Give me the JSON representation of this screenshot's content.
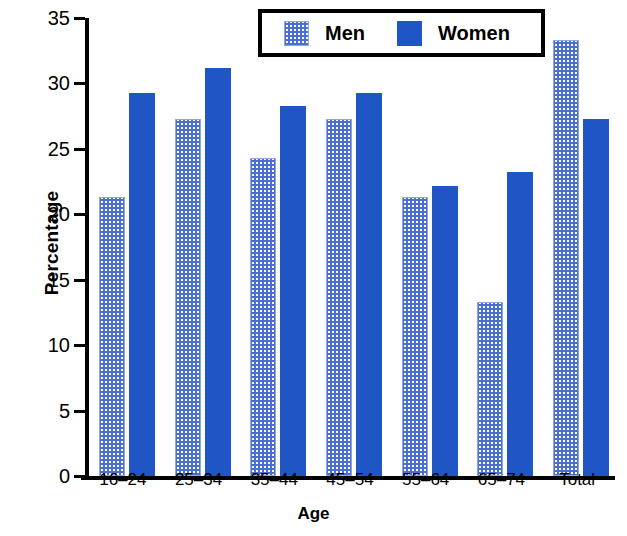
{
  "chart_data": {
    "type": "bar",
    "title": "",
    "xlabel": "Age",
    "ylabel": "Percentage",
    "categories": [
      "16–24",
      "25–34",
      "35–44",
      "45–54",
      "55–64",
      "65–74",
      "Total"
    ],
    "series": [
      {
        "name": "Men",
        "color": "#4a6fd0",
        "fill": "dotted-pattern",
        "values": [
          21.3,
          27.3,
          24.3,
          27.3,
          21.3,
          13.3,
          33.3
        ]
      },
      {
        "name": "Women",
        "color": "#1f55c4",
        "fill": "solid",
        "values": [
          29.3,
          31.2,
          28.3,
          29.3,
          22.2,
          23.2,
          27.3
        ]
      }
    ],
    "ylim": [
      0,
      35
    ],
    "yticks": [
      0,
      5,
      10,
      15,
      20,
      25,
      30,
      35
    ],
    "ytick_labels": [
      "0",
      "5",
      "10",
      "15",
      "20",
      "25",
      "30",
      "35"
    ],
    "grid": false,
    "legend_position": "top-center"
  },
  "legend": {
    "items": [
      {
        "label": "Men",
        "swatch": "men-pattern-swatch"
      },
      {
        "label": "Women",
        "swatch": "women-solid-swatch"
      }
    ]
  },
  "axes": {
    "y_title": "Percentage",
    "x_title": "Age"
  }
}
